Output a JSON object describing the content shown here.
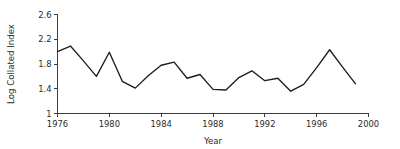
{
  "chart_data": {
    "type": "line",
    "title": "",
    "subtitle": "",
    "xlabel": "Year",
    "ylabel": "Log Collated Index",
    "xlim": [
      1976,
      2000
    ],
    "ylim": [
      1,
      2.6
    ],
    "xticks": [
      1976,
      1980,
      1984,
      1988,
      1992,
      1996,
      2000
    ],
    "xtick_labels": [
      "1976",
      "1980",
      "1984",
      "1988",
      "1992",
      "1996",
      "2000"
    ],
    "yticks": [
      1,
      1.4,
      1.8,
      2.2,
      2.6
    ],
    "ytick_labels": [
      "1",
      "1.4",
      "1.8",
      "2.2",
      "2.6"
    ],
    "grid": false,
    "legend": null,
    "line_color": "#1d1d1d",
    "axis_color": "#3c3c3c",
    "background_color": "#ffffff",
    "x": [
      1976,
      1977,
      1978,
      1979,
      1980,
      1981,
      1982,
      1983,
      1984,
      1985,
      1986,
      1987,
      1988,
      1989,
      1990,
      1991,
      1992,
      1993,
      1994,
      1995,
      1996,
      1997,
      1998,
      1999
    ],
    "values": [
      2.0,
      2.09,
      1.85,
      1.6,
      1.99,
      1.52,
      1.41,
      1.61,
      1.78,
      1.83,
      1.57,
      1.63,
      1.39,
      1.38,
      1.58,
      1.69,
      1.53,
      1.57,
      1.36,
      1.47,
      1.74,
      2.03,
      1.75,
      1.48
    ],
    "series": [
      {
        "name": "Log Collated Index",
        "values": [
          2.0,
          2.09,
          1.85,
          1.6,
          1.99,
          1.52,
          1.41,
          1.61,
          1.78,
          1.83,
          1.57,
          1.63,
          1.39,
          1.38,
          1.58,
          1.69,
          1.53,
          1.57,
          1.36,
          1.47,
          1.74,
          2.03,
          1.75,
          1.48
        ]
      }
    ]
  }
}
